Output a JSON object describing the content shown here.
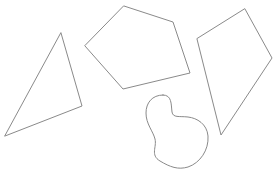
{
  "canvas": {
    "width": 279,
    "height": 179,
    "background_color": "#ffffff",
    "stroke_color": "#8a8a8a",
    "stroke_width": 1,
    "fill": "none"
  },
  "shapes": [
    {
      "name": "triangle",
      "label": "triangle",
      "kind": "polygon",
      "sides": 3,
      "points": [
        [
          61,
          33
        ],
        [
          82,
          106
        ],
        [
          5,
          136
        ]
      ],
      "path": "M 61 33 L 82 106 L 5 136 Z"
    },
    {
      "name": "pentagon",
      "label": "pentagon",
      "kind": "polygon",
      "sides": 5,
      "points": [
        [
          124,
          6
        ],
        [
          173,
          22
        ],
        [
          190,
          73
        ],
        [
          123,
          89
        ],
        [
          85,
          46
        ]
      ],
      "path": "M 124 6 L 173 22 L 190 73 L 123 89 L 85 46 Z"
    },
    {
      "name": "kite-quadrilateral",
      "label": "kite",
      "kind": "polygon",
      "sides": 4,
      "points": [
        [
          245,
          9
        ],
        [
          272,
          58
        ],
        [
          221,
          135
        ],
        [
          197,
          39
        ]
      ],
      "path": "M 245 9 L 272 58 L 221 135 L 197 39 Z"
    },
    {
      "name": "blob",
      "label": "blob",
      "kind": "curve",
      "sides": 0,
      "points": [
        [
          163,
          95
        ],
        [
          147,
          112
        ],
        [
          155,
          143
        ],
        [
          172,
          152
        ],
        [
          190,
          166
        ],
        [
          208,
          134
        ],
        [
          172,
          118
        ]
      ],
      "path": "M 163 95 C 152 95 146 103 146 113 C 146 124 153 131 155 139 C 157 147 150 155 160 161 C 170 167 178 170 188 167 C 200 163 209 150 208 136 C 207 124 197 118 188 117 C 179 116 173 118 172 112 C 171 104 172 95 163 95 Z"
    }
  ]
}
